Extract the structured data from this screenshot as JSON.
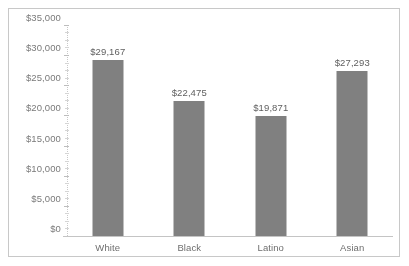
{
  "chart_data": {
    "type": "bar",
    "title": "",
    "subtitle": "",
    "xlabel": "",
    "ylabel": "",
    "categories": [
      "White",
      "Black",
      "Latino",
      "Asian"
    ],
    "values": [
      29167,
      22475,
      19871,
      27293
    ],
    "value_labels": [
      "$29,167",
      "$22,475",
      "$19,871",
      "$27,293"
    ],
    "ylim": [
      0,
      35000
    ],
    "ytick_values": [
      0,
      5000,
      10000,
      15000,
      20000,
      25000,
      30000,
      35000
    ],
    "ytick_labels": [
      "$0",
      "$5,000",
      "$10,000",
      "$15,000",
      "$20,000",
      "$25,000",
      "$30,000",
      "$35,000"
    ],
    "grid": false,
    "legend": null,
    "legend_position": "none",
    "series": [
      {
        "name": "",
        "values": [
          29167,
          22475,
          19871,
          27293
        ]
      }
    ]
  },
  "style": {
    "bar_color": "#808080",
    "axis_color": "#c4c4c4",
    "tick_label_color": "#7a7a7a",
    "value_label_color": "#5e5e5e",
    "category_label_color": "#6e6e6e",
    "border_color": "#c8c8c8",
    "background_color": "#ffffff"
  }
}
